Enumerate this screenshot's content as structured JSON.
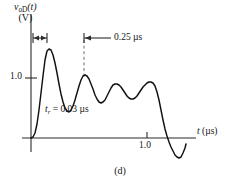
{
  "figure": {
    "panel_caption": "(d)",
    "y_axis": {
      "quantity": "v",
      "quantity_sub": "oD",
      "quantity_arg": "(t)",
      "unit_line": "(V)",
      "ticks": [
        {
          "value": "1.0",
          "y_px": 78
        }
      ]
    },
    "x_axis": {
      "label_symbol": "t",
      "label_unit": "(µs)",
      "ticks": [
        {
          "value": "1.0",
          "x_px": 147
        }
      ]
    },
    "annotations": [
      {
        "id": "rise-time",
        "text_symbol": "t",
        "text_sub": "r",
        "text_rest": " = 0.03 µs",
        "full_text": "t_r = 0.03 µs",
        "marker": "double-headed-arrow",
        "marker_x_start": 33,
        "marker_x_end": 47,
        "marker_y": 38
      },
      {
        "id": "ring-period",
        "full_text": "0.25 µs",
        "marker": "left-arrow-with-bar",
        "marker_x_start": 84,
        "marker_x_end": 110,
        "marker_y": 38,
        "dashed_guide_x": 84,
        "dashed_guide_y_top": 40,
        "dashed_guide_y_bottom": 75
      }
    ],
    "colors": {
      "axis": "#2b2b2b",
      "curve": "#111111",
      "dashed_guide": "#6d6d6d",
      "text": "#141414",
      "background": "#ffffff"
    }
  },
  "chart_data": {
    "type": "line",
    "title": "",
    "subtitle": "(d)",
    "xlabel": "t (µs)",
    "ylabel": "v_oD(t) (V)",
    "xlim": [
      0,
      1.55
    ],
    "ylim": [
      -0.45,
      1.95
    ],
    "grid": false,
    "legend": null,
    "axis_origin_px": {
      "x": 31,
      "y": 138
    },
    "scale_px": {
      "x_per_unit": 116,
      "y_per_unit": 60
    },
    "series": [
      {
        "name": "v_oD(t)",
        "description": "Step response with underdamped ringing, rise time 0.03 us, ringing period 0.25 us, then falling edge with undershoot",
        "points_px": [
          [
            31,
            138
          ],
          [
            33,
            137
          ],
          [
            35,
            133
          ],
          [
            37,
            124
          ],
          [
            39,
            110
          ],
          [
            41,
            93
          ],
          [
            43,
            76
          ],
          [
            45,
            60
          ],
          [
            47,
            51
          ],
          [
            49,
            49
          ],
          [
            51,
            50
          ],
          [
            53,
            55
          ],
          [
            55,
            63
          ],
          [
            57,
            73
          ],
          [
            59,
            84
          ],
          [
            61,
            94
          ],
          [
            63,
            102
          ],
          [
            65,
            108
          ],
          [
            67,
            111
          ],
          [
            69,
            112
          ],
          [
            71,
            110
          ],
          [
            73,
            106
          ],
          [
            75,
            100
          ],
          [
            77,
            93
          ],
          [
            79,
            86
          ],
          [
            81,
            80
          ],
          [
            83,
            76
          ],
          [
            85,
            75
          ],
          [
            87,
            76
          ],
          [
            89,
            79
          ],
          [
            91,
            84
          ],
          [
            93,
            89
          ],
          [
            95,
            95
          ],
          [
            97,
            99
          ],
          [
            99,
            102
          ],
          [
            101,
            103
          ],
          [
            103,
            102
          ],
          [
            105,
            100
          ],
          [
            107,
            96
          ],
          [
            109,
            92
          ],
          [
            111,
            88
          ],
          [
            113,
            85
          ],
          [
            115,
            84
          ],
          [
            117,
            84
          ],
          [
            119,
            85
          ],
          [
            121,
            87
          ],
          [
            123,
            90
          ],
          [
            125,
            93
          ],
          [
            127,
            96
          ],
          [
            129,
            98
          ],
          [
            131,
            99
          ],
          [
            133,
            99
          ],
          [
            135,
            98
          ],
          [
            137,
            96
          ],
          [
            139,
            93
          ],
          [
            141,
            90
          ],
          [
            143,
            87
          ],
          [
            145,
            85
          ],
          [
            147,
            83
          ],
          [
            149,
            82
          ],
          [
            151,
            82
          ],
          [
            153,
            83
          ],
          [
            155,
            86
          ],
          [
            157,
            92
          ],
          [
            159,
            100
          ],
          [
            161,
            110
          ],
          [
            163,
            120
          ],
          [
            165,
            129
          ],
          [
            167,
            136
          ],
          [
            169,
            142
          ],
          [
            171,
            147
          ],
          [
            173,
            151
          ],
          [
            175,
            155
          ],
          [
            177,
            157
          ],
          [
            179,
            158
          ],
          [
            181,
            157
          ],
          [
            183,
            153
          ],
          [
            185,
            148
          ],
          [
            186,
            144
          ]
        ],
        "key_points": [
          {
            "label": "peak-1",
            "x_us": 0.13,
            "y_v": 1.48
          },
          {
            "label": "trough-1",
            "x_us": 0.34,
            "y_v": 0.44
          },
          {
            "label": "peak-2",
            "x_us": 0.46,
            "y_v": 1.05
          },
          {
            "label": "trough-2",
            "x_us": 0.6,
            "y_v": 0.59
          },
          {
            "label": "peak-3",
            "x_us": 0.74,
            "y_v": 0.9
          },
          {
            "label": "trough-3",
            "x_us": 0.87,
            "y_v": 0.66
          },
          {
            "label": "peak-4",
            "x_us": 1.03,
            "y_v": 0.94
          },
          {
            "label": "zero-cross-fall",
            "x_us": 1.2,
            "y_v": 0.0
          },
          {
            "label": "undershoot-min",
            "x_us": 1.29,
            "y_v": -0.33
          }
        ]
      }
    ],
    "annotations": [
      {
        "text": "t_r = 0.03 µs",
        "type": "rise-time"
      },
      {
        "text": "0.25 µs",
        "type": "ringing-period"
      }
    ]
  }
}
